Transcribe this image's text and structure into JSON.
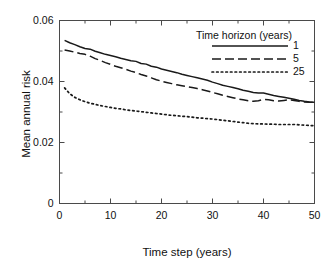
{
  "chart_data": {
    "type": "line",
    "title": "",
    "xlabel": "Time step (years)",
    "ylabel": "Mean annual risk",
    "xlim": [
      0,
      50
    ],
    "ylim": [
      0,
      0.06
    ],
    "grid": false,
    "xticks": [
      0,
      10,
      20,
      30,
      40,
      50
    ],
    "xtick_labels": [
      "0",
      "10",
      "20",
      "30",
      "40",
      "50"
    ],
    "xminor_ticks": [
      5,
      15,
      25,
      35,
      45
    ],
    "yticks": [
      0,
      0.02,
      0.04,
      0.06
    ],
    "ytick_labels": [
      "0",
      "0.02",
      "0.04",
      "0.06"
    ],
    "legend": {
      "title": "Time horizon (years)",
      "position": "top-right",
      "entries": [
        {
          "label": "1",
          "style": "solid"
        },
        {
          "label": "5",
          "style": "dashed"
        },
        {
          "label": "25",
          "style": "dotted"
        }
      ]
    },
    "x": [
      1,
      2,
      3,
      4,
      5,
      6,
      7,
      8,
      9,
      10,
      11,
      12,
      13,
      14,
      15,
      16,
      17,
      18,
      19,
      20,
      21,
      22,
      23,
      24,
      25,
      26,
      27,
      28,
      29,
      30,
      31,
      32,
      33,
      34,
      35,
      36,
      37,
      38,
      39,
      40,
      41,
      42,
      43,
      44,
      45,
      46,
      47,
      48,
      49,
      50
    ],
    "series": [
      {
        "name": "1",
        "style": "solid",
        "color": "#1a1a1a",
        "values": [
          0.0535,
          0.0527,
          0.0521,
          0.0514,
          0.0508,
          0.0506,
          0.0499,
          0.0494,
          0.0489,
          0.0485,
          0.0481,
          0.0476,
          0.0472,
          0.0468,
          0.0466,
          0.0459,
          0.0457,
          0.045,
          0.0447,
          0.0441,
          0.0437,
          0.0433,
          0.0429,
          0.0424,
          0.042,
          0.0416,
          0.0412,
          0.0408,
          0.0404,
          0.0398,
          0.0393,
          0.0388,
          0.0384,
          0.038,
          0.0376,
          0.0371,
          0.0368,
          0.0364,
          0.0362,
          0.0362,
          0.0358,
          0.0354,
          0.0351,
          0.0348,
          0.0345,
          0.0342,
          0.0338,
          0.0335,
          0.0333,
          0.0332
        ]
      },
      {
        "name": "5",
        "style": "dashed",
        "color": "#1a1a1a",
        "values": [
          0.0503,
          0.05,
          0.0496,
          0.0492,
          0.0489,
          0.0483,
          0.0475,
          0.0469,
          0.0462,
          0.0456,
          0.045,
          0.0445,
          0.044,
          0.0434,
          0.0429,
          0.0423,
          0.0418,
          0.0412,
          0.0406,
          0.0401,
          0.0397,
          0.0393,
          0.0389,
          0.0386,
          0.0383,
          0.038,
          0.0377,
          0.0373,
          0.0369,
          0.0364,
          0.036,
          0.0355,
          0.0351,
          0.0347,
          0.0343,
          0.034,
          0.0337,
          0.0335,
          0.0337,
          0.0341,
          0.034,
          0.0337,
          0.0336,
          0.0338,
          0.034,
          0.0338,
          0.0335,
          0.0333,
          0.0332,
          0.0332
        ]
      },
      {
        "name": "25",
        "style": "dotted",
        "color": "#1a1a1a",
        "values": [
          0.0379,
          0.036,
          0.0348,
          0.034,
          0.0334,
          0.0329,
          0.0325,
          0.0321,
          0.0318,
          0.0315,
          0.0312,
          0.031,
          0.0307,
          0.0305,
          0.0303,
          0.0301,
          0.0299,
          0.0297,
          0.0295,
          0.0293,
          0.0291,
          0.0289,
          0.0288,
          0.0286,
          0.0285,
          0.0283,
          0.0281,
          0.028,
          0.0278,
          0.0277,
          0.0275,
          0.0273,
          0.0271,
          0.0269,
          0.0267,
          0.0265,
          0.0263,
          0.0262,
          0.0261,
          0.0261,
          0.026,
          0.026,
          0.0259,
          0.0259,
          0.0259,
          0.0259,
          0.0258,
          0.0257,
          0.0256,
          0.0255
        ]
      }
    ]
  }
}
